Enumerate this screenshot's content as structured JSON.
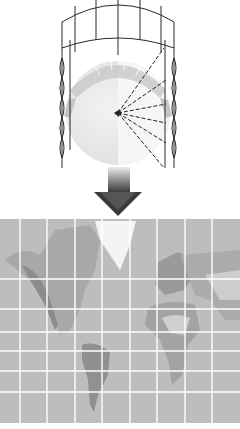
{
  "cylinder": {
    "meridian_count": 7,
    "ring_count": 6,
    "stroke_color": "#2a2a2a"
  },
  "globe": {
    "light_color": "#ececec",
    "shadow_color": "#dadada",
    "projection_rays": 6
  },
  "arrow": {
    "direction": "down",
    "color_top": "#e8e8e8",
    "color_bottom": "#333333"
  },
  "map": {
    "ocean_color": "#bdbdbd",
    "land_color": "#9a9a9a",
    "ice_color": "#f4f4f4",
    "grid_color": "#ffffff",
    "vertical_lines_x": [
      20,
      47,
      75,
      102,
      130,
      157,
      185,
      212
    ],
    "horizontal_lines_y": [
      279,
      309,
      332,
      351,
      371,
      392
    ]
  }
}
